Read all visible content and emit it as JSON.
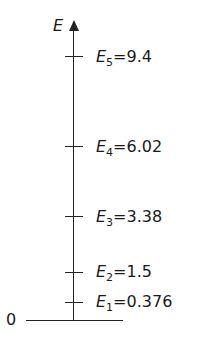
{
  "diagram": {
    "axis": {
      "label": "E",
      "origin_label": "0"
    },
    "levels": [
      {
        "symbol": "E",
        "sub": "5",
        "eq": "=9.4",
        "value": 9.4,
        "y": 57
      },
      {
        "symbol": "E",
        "sub": "4",
        "eq": "=6.02",
        "value": 6.02,
        "y": 147
      },
      {
        "symbol": "E",
        "sub": "3",
        "eq": "=3.38",
        "value": 3.38,
        "y": 217
      },
      {
        "symbol": "E",
        "sub": "2",
        "eq": "=1.5",
        "value": 1.5,
        "y": 272
      },
      {
        "symbol": "E",
        "sub": "1",
        "eq": "=0.376",
        "value": 0.376,
        "y": 302
      }
    ]
  }
}
